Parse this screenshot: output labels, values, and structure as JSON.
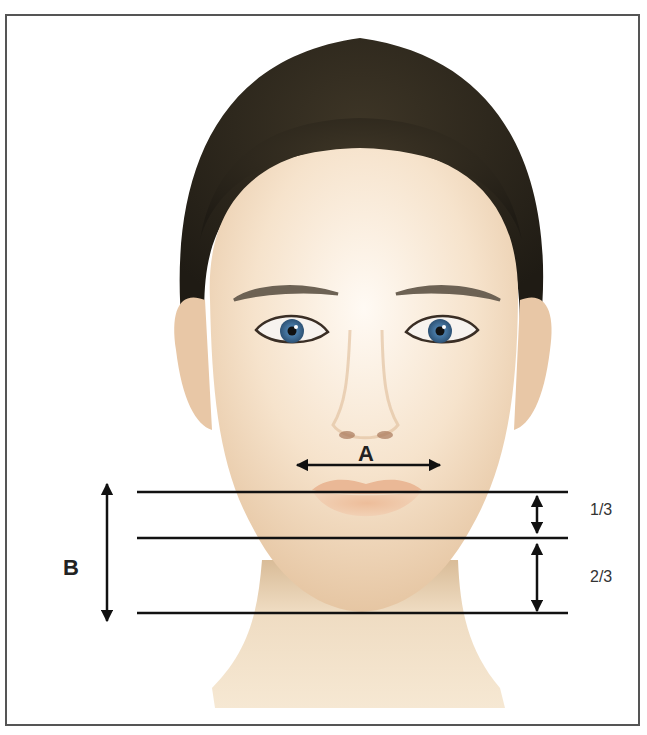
{
  "figure": {
    "labels": {
      "width_label": "A",
      "height_label": "B",
      "upper_fraction": "1/3",
      "lower_fraction": "2/3"
    },
    "colors": {
      "border": "#555555",
      "lines": "#111111",
      "skin": "#f3dcc0",
      "hair": "#2e2a1f",
      "iris": "#3f6f9a"
    }
  }
}
